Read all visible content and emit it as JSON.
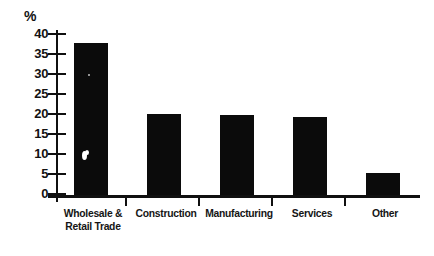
{
  "chart_data": {
    "type": "bar",
    "title": "",
    "subtitle": "",
    "xlabel": "",
    "ylabel": "%",
    "unit_symbol": "%",
    "categories": [
      "Wholesale & Retail Trade",
      "Construction",
      "Manufacturing",
      "Services",
      "Other"
    ],
    "category_lines": [
      [
        "Wholesale &",
        "Retail Trade"
      ],
      [
        "Construction"
      ],
      [
        "Manufacturing"
      ],
      [
        "Services"
      ],
      [
        "Other"
      ]
    ],
    "values": [
      37.5,
      20.0,
      19.8,
      19.3,
      5.5
    ],
    "ylim": [
      0,
      40
    ],
    "ytick_values": [
      40,
      35,
      30,
      25,
      20,
      15,
      10,
      5,
      0
    ],
    "ytick_labels": [
      "40",
      "35",
      "30",
      "25",
      "20",
      "15",
      "10",
      "5",
      "0"
    ],
    "grid": false,
    "legend": false,
    "legend_position": "none",
    "bar_color": "#0b0b0b",
    "axis_color": "#101010",
    "background_color": "#ffffff"
  }
}
